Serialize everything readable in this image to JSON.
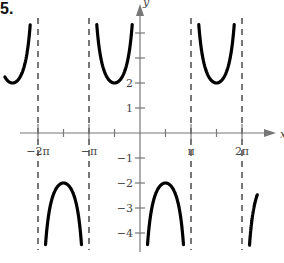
{
  "problem_label": "5.",
  "chart_data": {
    "type": "line",
    "title": "",
    "function": "y = -2 csc(x)",
    "xlabel": "x",
    "ylabel": "y",
    "xlim": [
      -8.2,
      8.4
    ],
    "ylim": [
      -4.5,
      4.5
    ],
    "grid": false,
    "x_ticks": [
      {
        "value": -6.2832,
        "label": "−2π"
      },
      {
        "value": -4.7124,
        "label": ""
      },
      {
        "value": -3.1416,
        "label": "−π"
      },
      {
        "value": -1.5708,
        "label": ""
      },
      {
        "value": 1.5708,
        "label": ""
      },
      {
        "value": 3.1416,
        "label": "π"
      },
      {
        "value": 4.7124,
        "label": ""
      },
      {
        "value": 6.2832,
        "label": "2π"
      }
    ],
    "y_ticks": [
      {
        "value": 4,
        "label": ""
      },
      {
        "value": 3,
        "label": ""
      },
      {
        "value": 2,
        "label": "2"
      },
      {
        "value": 1,
        "label": "1"
      },
      {
        "value": -1,
        "label": "−1"
      },
      {
        "value": -2,
        "label": "−2"
      },
      {
        "value": -3,
        "label": "−3"
      },
      {
        "value": -4,
        "label": "−4"
      }
    ],
    "asymptotes_x": [
      -6.2832,
      -3.1416,
      3.1416,
      6.2832
    ],
    "key_points": [
      {
        "x": -4.7124,
        "y": -2
      },
      {
        "x": -1.5708,
        "y": 2
      },
      {
        "x": 1.5708,
        "y": -2
      },
      {
        "x": 4.7124,
        "y": 2
      }
    ],
    "series": [
      {
        "name": "y = -2csc(x)",
        "color": "#000000"
      }
    ]
  }
}
